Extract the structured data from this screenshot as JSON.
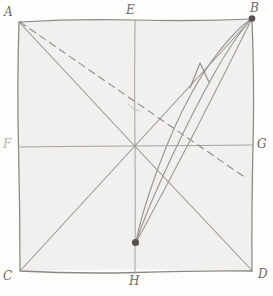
{
  "figure": {
    "canvas": {
      "width": 273,
      "height": 296
    },
    "background_color": "#fdfdfc",
    "square_fill": "#f2f1ef",
    "ink_color": "#8e8b87",
    "ink_color_light": "#a9a6a2",
    "dot_color": "#595652",
    "square": {
      "left": 19,
      "top": 21,
      "right": 252,
      "bottom": 271
    },
    "labels": [
      {
        "name": "A",
        "text": "A",
        "x": 4,
        "y": 6,
        "faint": false
      },
      {
        "name": "E",
        "text": "E",
        "x": 126,
        "y": 4,
        "faint": false
      },
      {
        "name": "B",
        "text": "B",
        "x": 250,
        "y": 2,
        "faint": false
      },
      {
        "name": "F",
        "text": "F",
        "x": 3,
        "y": 138,
        "faint": true
      },
      {
        "name": "G",
        "text": "G",
        "x": 257,
        "y": 138,
        "faint": false
      },
      {
        "name": "C",
        "text": "C",
        "x": 3,
        "y": 270,
        "faint": false
      },
      {
        "name": "H",
        "text": "H",
        "x": 129,
        "y": 275,
        "faint": false
      },
      {
        "name": "D",
        "text": "D",
        "x": 258,
        "y": 268,
        "faint": false
      }
    ],
    "points": [
      {
        "name": "A",
        "x": 19,
        "y": 21,
        "marked": false
      },
      {
        "name": "E",
        "x": 135,
        "y": 21,
        "marked": false
      },
      {
        "name": "B",
        "x": 252,
        "y": 18,
        "marked": true
      },
      {
        "name": "F",
        "x": 19,
        "y": 147,
        "marked": false
      },
      {
        "name": "G",
        "x": 252,
        "y": 145,
        "marked": false
      },
      {
        "name": "O",
        "x": 135,
        "y": 146,
        "marked": false
      },
      {
        "name": "C",
        "x": 20,
        "y": 271,
        "marked": false
      },
      {
        "name": "H",
        "x": 135,
        "y": 271,
        "marked": false
      },
      {
        "name": "D",
        "x": 252,
        "y": 271,
        "marked": false
      },
      {
        "name": "P",
        "x": 135,
        "y": 243,
        "marked": true
      }
    ],
    "segments": [
      {
        "name": "side-AB-top",
        "from": "A",
        "to": "B",
        "style": "solid"
      },
      {
        "name": "side-CD-bottom",
        "from": "C",
        "to": "D",
        "style": "solid"
      },
      {
        "name": "side-AC-left",
        "from": "A",
        "to": "C",
        "style": "solid"
      },
      {
        "name": "side-BD-right",
        "from": "B",
        "to": "D",
        "style": "solid"
      },
      {
        "name": "median-EH-vertical",
        "from": "E",
        "to": "H",
        "style": "solid"
      },
      {
        "name": "median-FG-horizontal",
        "from": "F",
        "to": "G",
        "style": "solid"
      },
      {
        "name": "diagonal-AD",
        "from": "A",
        "to": "D",
        "style": "solid"
      },
      {
        "name": "diagonal-CB",
        "from": "C",
        "to": "B",
        "style": "solid"
      },
      {
        "name": "line-AX-dashed",
        "from": "A",
        "to": "X",
        "style": "dashed"
      },
      {
        "name": "chord-P-to-B",
        "from": "P",
        "to": "B",
        "style": "solid"
      }
    ],
    "curves": [
      {
        "name": "curve-left-with-arrow",
        "from": "P",
        "to": "B",
        "arrow": true
      },
      {
        "name": "curve-right",
        "from": "P",
        "to": "B",
        "arrow": false
      }
    ],
    "dashed_line": {
      "name": "dashed-ray-from-A",
      "from_x": 19,
      "from_y": 21,
      "to_x": 243,
      "to_y": 176
    }
  }
}
